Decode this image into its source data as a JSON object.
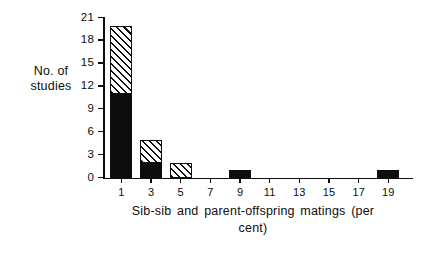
{
  "chart_data": {
    "type": "bar",
    "title": "",
    "xlabel": "Sib-sib and parent-offspring matings (per cent)",
    "ylabel": "No. of studies",
    "categories": [
      "1",
      "3",
      "5",
      "7",
      "9",
      "11",
      "13",
      "15",
      "17",
      "19"
    ],
    "series": [
      {
        "name": "solid",
        "values": [
          11,
          2,
          0,
          0,
          1,
          0,
          0,
          0,
          0,
          1
        ]
      },
      {
        "name": "hatched",
        "values": [
          9,
          3,
          2,
          0,
          0,
          0,
          0,
          0,
          0,
          0
        ]
      }
    ],
    "stacked": true,
    "totals": [
      20,
      5,
      2,
      0,
      1,
      0,
      0,
      0,
      0,
      1
    ],
    "ylim": [
      0,
      21
    ],
    "yticks": [
      "0",
      "3",
      "6",
      "9",
      "12",
      "15",
      "18",
      "21"
    ],
    "xticks": [
      "1",
      "3",
      "5",
      "7",
      "9",
      "11",
      "13",
      "15",
      "17",
      "19"
    ],
    "grid": false,
    "legend": "none",
    "colors": {
      "solid": "#0d0d0d",
      "hatch_line": "#0d0d0d",
      "background": "#ffffff"
    }
  },
  "axes": {
    "ylabel_line1": "No. of",
    "ylabel_line2": "studies",
    "xlabel_line1": "Sib-sib  and  parent-offspring  matings  (per",
    "xlabel_line2": "cent)"
  }
}
